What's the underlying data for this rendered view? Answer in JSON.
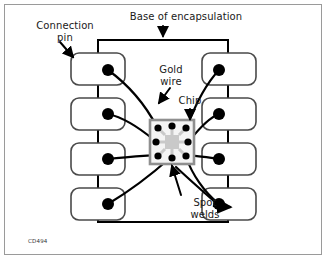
{
  "figure": {
    "code": "CD494",
    "width": 327,
    "height": 260
  },
  "labels": {
    "connection_pin": "Connection\npin",
    "base_of_encapsulation": "Base of encapsulation",
    "gold_wire": "Gold\nwire",
    "chip": "Chip",
    "spot_welds": "Spot\nwelds"
  },
  "colors": {
    "ink": "#000000",
    "frame": "#9a9a9a",
    "pin_outline": "#4a4a4a",
    "chip_outline": "#8c8c8c",
    "chip_fill": "#f2f2f2",
    "die_fill": "#c8c8c8",
    "background": "#ffffff"
  },
  "diagram": {
    "encapsulation": {
      "x": 95,
      "y": 38,
      "width": 136,
      "height": 186
    },
    "pins_left": [
      {
        "id": "pin-left-1",
        "x": 71,
        "y": 53,
        "width": 54,
        "height": 30,
        "weld_cx": 108,
        "weld_cy": 70
      },
      {
        "id": "pin-left-2",
        "x": 71,
        "y": 98,
        "width": 54,
        "height": 30,
        "weld_cx": 108,
        "weld_cy": 113
      },
      {
        "id": "pin-left-3",
        "x": 71,
        "y": 143,
        "width": 54,
        "height": 30,
        "weld_cx": 108,
        "weld_cy": 158
      },
      {
        "id": "pin-left-4",
        "x": 71,
        "y": 188,
        "width": 54,
        "height": 30,
        "weld_cx": 108,
        "weld_cy": 203
      }
    ],
    "pins_right": [
      {
        "id": "pin-right-1",
        "x": 232,
        "y": 53,
        "width": 54,
        "height": 30,
        "weld_cx": 248,
        "weld_cy": 70
      },
      {
        "id": "pin-right-2",
        "x": 232,
        "y": 98,
        "width": 54,
        "height": 30,
        "weld_cx": 248,
        "weld_cy": 113
      },
      {
        "id": "pin-right-3",
        "x": 232,
        "y": 143,
        "width": 54,
        "height": 30,
        "weld_cx": 248,
        "weld_cy": 158
      },
      {
        "id": "pin-right-4",
        "x": 232,
        "y": 188,
        "width": 54,
        "height": 30,
        "weld_cx": 248,
        "weld_cy": 203
      }
    ],
    "chip": {
      "x": 150,
      "y": 120,
      "width": 44,
      "height": 44
    },
    "die": {
      "x": 165,
      "y": 135,
      "width": 14,
      "height": 14
    },
    "chip_pads": [
      {
        "id": "pad-tl",
        "cx": 158,
        "cy": 128
      },
      {
        "id": "pad-tc",
        "cx": 172,
        "cy": 126
      },
      {
        "id": "pad-tr",
        "cx": 186,
        "cy": 128
      },
      {
        "id": "pad-ml",
        "cx": 156,
        "cy": 142
      },
      {
        "id": "pad-mr",
        "cx": 188,
        "cy": 142
      },
      {
        "id": "pad-bl",
        "cx": 158,
        "cy": 156
      },
      {
        "id": "pad-bc",
        "cx": 172,
        "cy": 158
      },
      {
        "id": "pad-br",
        "cx": 186,
        "cy": 156
      }
    ],
    "wires": [
      {
        "id": "wire-left-1",
        "d": "M 108 70 C 128 84 146 104 158 128"
      },
      {
        "id": "wire-left-2",
        "d": "M 108 113 C 126 118 142 132 156 142"
      },
      {
        "id": "wire-left-3",
        "d": "M 108 158 C 126 156 144 156 158 156"
      },
      {
        "id": "wire-left-4",
        "d": "M 108 203 C 126 192 150 174 172 158"
      },
      {
        "id": "wire-right-1",
        "d": "M 248 70 C 228 84 204 104 186 128"
      },
      {
        "id": "wire-right-2",
        "d": "M 248 113 C 228 118 204 132 188 142"
      },
      {
        "id": "wire-right-3",
        "d": "M 248 158 C 228 156 202 156 186 156"
      },
      {
        "id": "wire-right-4",
        "d": "M 248 203 C 228 194 200 176 186 156"
      }
    ],
    "leaders": [
      {
        "id": "leader-connection-pin",
        "d": "M 62 44 L 76 60",
        "arrow": true
      },
      {
        "id": "leader-base",
        "d": "M 186 26 L 186 36",
        "arrow": true
      },
      {
        "id": "leader-gold-wire",
        "d": "M 168 88 L 158 102",
        "arrow": true
      },
      {
        "id": "leader-chip",
        "d": "M 189 110 L 189 120",
        "arrow": true
      },
      {
        "id": "leader-spot-welds-up",
        "d": "M 176 192 L 168 166",
        "arrow": true
      },
      {
        "id": "leader-spot-welds-right",
        "d": "M 229 207 L 246 203",
        "arrow": true
      }
    ]
  }
}
